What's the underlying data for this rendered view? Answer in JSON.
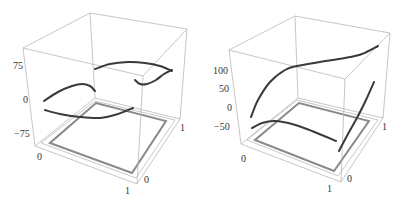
{
  "chart_data": [
    {
      "type": "line",
      "subtype": "3d-curves",
      "title": "",
      "xlabel": "",
      "ylabel": "",
      "zlabel": "",
      "x_ticks": [
        "0",
        "1"
      ],
      "y_ticks": [
        "0",
        "1"
      ],
      "z_ticks": [
        "75",
        "0",
        "−75"
      ],
      "zlim": [
        -100,
        110
      ],
      "grid": false,
      "box": {
        "TBL": [
          90,
          13
        ],
        "TBR": [
          187,
          29
        ],
        "TFL": [
          23,
          48
        ],
        "TFR": [
          143,
          76
        ],
        "BBL": [
          95,
          98
        ],
        "BBR": [
          180,
          119
        ],
        "BFL": [
          35,
          146
        ],
        "BFR": [
          137,
          184
        ]
      },
      "base_frame": {
        "outer": [
          [
            41,
            143
          ],
          [
            136,
            178
          ],
          [
            175,
            120
          ],
          [
            95,
            101
          ]
        ],
        "inner": [
          [
            50,
            143
          ],
          [
            132,
            173
          ],
          [
            166,
            121
          ],
          [
            96,
            103
          ]
        ]
      },
      "curves": [
        {
          "name": "curve-1",
          "points": [
            [
              44,
              101
            ],
            [
              58,
              92
            ],
            [
              72,
              86
            ],
            [
              82,
              84
            ],
            [
              90,
              86
            ],
            [
              95,
              91
            ]
          ]
        },
        {
          "name": "curve-2",
          "points": [
            [
              45,
              110
            ],
            [
              60,
              114
            ],
            [
              80,
              117
            ],
            [
              100,
              118
            ],
            [
              118,
              114
            ],
            [
              133,
              108
            ]
          ]
        },
        {
          "name": "curve-3",
          "points": [
            [
              95,
              69
            ],
            [
              110,
              64
            ],
            [
              128,
              62
            ],
            [
              145,
              63
            ],
            [
              160,
              66
            ],
            [
              172,
              71
            ]
          ]
        },
        {
          "name": "curve-4",
          "points": [
            [
              135,
              80
            ],
            [
              140,
              84
            ],
            [
              147,
              84
            ],
            [
              156,
              80
            ],
            [
              164,
              74
            ],
            [
              172,
              70
            ]
          ]
        }
      ],
      "tick_labels": [
        {
          "text": "75",
          "x": 13,
          "y": 69
        },
        {
          "text": "0",
          "x": 23,
          "y": 103
        },
        {
          "text": "−75",
          "x": 14,
          "y": 137
        },
        {
          "text": "0",
          "x": 37,
          "y": 160
        },
        {
          "text": "1",
          "x": 125,
          "y": 194
        },
        {
          "text": "0",
          "x": 144,
          "y": 183
        },
        {
          "text": "1",
          "x": 180,
          "y": 131
        }
      ]
    },
    {
      "type": "line",
      "subtype": "3d-curves",
      "title": "",
      "xlabel": "",
      "ylabel": "",
      "zlabel": "",
      "x_ticks": [
        "0",
        "1"
      ],
      "y_ticks": [
        "0",
        "1"
      ],
      "z_ticks": [
        "100",
        "50",
        "0",
        "−50"
      ],
      "zlim": [
        -80,
        160
      ],
      "grid": false,
      "box": {
        "TBL": [
          295,
          16
        ],
        "TBR": [
          390,
          33
        ],
        "TFL": [
          229,
          50
        ],
        "TFR": [
          345,
          79
        ],
        "BBL": [
          298,
          98
        ],
        "BBR": [
          383,
          118
        ],
        "BFL": [
          241,
          144
        ],
        "BFR": [
          341,
          182
        ]
      },
      "base_frame": {
        "outer": [
          [
            247,
            140
          ],
          [
            338,
            176
          ],
          [
            378,
            120
          ],
          [
            297,
            100
          ]
        ],
        "inner": [
          [
            255,
            140
          ],
          [
            334,
            171
          ],
          [
            369,
            121
          ],
          [
            299,
            103
          ]
        ]
      },
      "curves": [
        {
          "name": "curve-1",
          "points": [
            [
              251,
              117
            ],
            [
              258,
              100
            ],
            [
              270,
              82
            ],
            [
              285,
              70
            ],
            [
              297,
              66
            ],
            [
              320,
              62
            ],
            [
              345,
              58
            ],
            [
              362,
              54
            ],
            [
              378,
              46
            ]
          ]
        },
        {
          "name": "curve-2",
          "points": [
            [
              252,
              128
            ],
            [
              262,
              123
            ],
            [
              275,
              121
            ],
            [
              292,
              124
            ],
            [
              312,
              131
            ],
            [
              336,
              141
            ]
          ]
        },
        {
          "name": "curve-3",
          "points": [
            [
              339,
              151
            ],
            [
              348,
              134
            ],
            [
              358,
              116
            ],
            [
              366,
              100
            ],
            [
              374,
              82
            ]
          ]
        }
      ],
      "tick_labels": [
        {
          "text": "100",
          "x": 213,
          "y": 74
        },
        {
          "text": "50",
          "x": 219,
          "y": 92
        },
        {
          "text": "0",
          "x": 227,
          "y": 111
        },
        {
          "text": "−50",
          "x": 214,
          "y": 130
        },
        {
          "text": "0",
          "x": 241,
          "y": 162
        },
        {
          "text": "1",
          "x": 327,
          "y": 192
        },
        {
          "text": "0",
          "x": 347,
          "y": 182
        },
        {
          "text": "1",
          "x": 382,
          "y": 130
        }
      ]
    }
  ],
  "colors": {
    "box": "#b8b8b8",
    "frame_outer": "#c8c8c8",
    "frame_inner": "#8a8a8a",
    "curve": "#3a3a3a",
    "label": "#333333"
  }
}
